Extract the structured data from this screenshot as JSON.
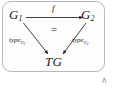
{
  "diagram": {
    "type": "commutative-triangle",
    "frame": {
      "shape": "rounded-rectangle",
      "border_color": "#b9b9b9"
    },
    "nodes": [
      {
        "id": "g1",
        "base": "G",
        "subscript": "1",
        "position": "top-left"
      },
      {
        "id": "g2",
        "base": "G",
        "subscript": "2",
        "position": "top-right"
      },
      {
        "id": "tg",
        "base": "TG",
        "subscript": "",
        "position": "bottom-center"
      }
    ],
    "edges": [
      {
        "id": "f",
        "label": "f",
        "from": "g1",
        "to": "g2",
        "direction": "horizontal-right"
      },
      {
        "id": "type_g1",
        "label": "type",
        "subscript": "G",
        "subsubscript": "1",
        "from": "g1",
        "to": "tg",
        "direction": "diagonal-down-right"
      },
      {
        "id": "type_g2",
        "label": "type",
        "subscript": "G",
        "subsubscript": "2",
        "from": "g2",
        "to": "tg",
        "direction": "diagonal-down-left"
      }
    ],
    "center_marker": "=",
    "caret_mark": "∧",
    "colors": {
      "ink": "#1b1b1b",
      "arrow": "#2a2a2a",
      "border": "#b9b9b9",
      "caret": "#9a9a9a",
      "background": "#ffffff"
    }
  }
}
